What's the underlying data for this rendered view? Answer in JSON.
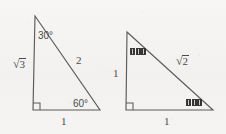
{
  "figure": {
    "background_color": "#f4f3f1",
    "stroke_color": "#5b5b5b",
    "text_color": "#4a4a4a"
  },
  "triangles": [
    {
      "name": "30-60-90-triangle",
      "description": "Right triangle with 30 and 60 degree acute angles",
      "vertices": {
        "apex": [
          35,
          16
        ],
        "right_angle": [
          33,
          110
        ],
        "base_right": [
          100,
          110
        ]
      },
      "right_angle_corner": "bottom-left",
      "labels": {
        "apex_angle": "30°",
        "base_right_angle": "60°",
        "vertical_leg": {
          "surd": "√",
          "radicand": "3"
        },
        "hypotenuse": "2",
        "horizontal_leg": "1"
      }
    },
    {
      "name": "45-45-90-triangle",
      "description": "Isosceles right triangle with two 45 degree acute angles",
      "vertices": {
        "apex": [
          127,
          32
        ],
        "right_angle": [
          126,
          110
        ],
        "base_right": [
          213,
          110
        ]
      },
      "right_angle_corner": "bottom-left",
      "labels": {
        "apex_angle_glyphs": 3,
        "base_right_angle_glyphs": 3,
        "vertical_leg": "1",
        "hypotenuse": {
          "surd": "√",
          "radicand": "2"
        },
        "horizontal_leg": "1"
      }
    }
  ]
}
